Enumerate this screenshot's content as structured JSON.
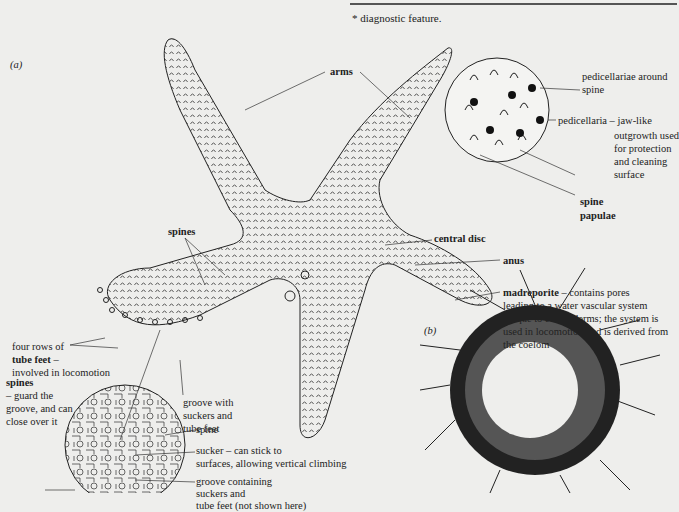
{
  "footnote": "* diagnostic feature.",
  "panel_a": {
    "label": "(a)",
    "labels": {
      "arms": "arms",
      "spines": "spines",
      "central_disc": "central disc",
      "anus": "anus",
      "madreporite_title": "madreporite",
      "madreporite_desc": [
        " – contains pores",
        "leading to a water vascular system",
        "unique to echinoderms; the system is",
        "used in locomotion and is derived from",
        "the coelom"
      ],
      "tube_feet_line1": "four rows of",
      "tube_feet_title": "tube feet",
      "tube_feet_dash": " –",
      "tube_feet_desc": "involved in locomotion",
      "groove_with": [
        "groove with",
        "suckers and",
        "tube feet"
      ]
    },
    "inset_pedicellariae": {
      "pedicellariae_around": [
        "pedicellariae around",
        "spine"
      ],
      "pedicellaria": [
        "pedicellaria – jaw-like",
        "outgrowth used",
        "for protection",
        "and cleaning",
        "surface"
      ],
      "spine": "spine",
      "papulae": "papulae"
    },
    "inset_groove": {
      "spines_title": "spines",
      "spines_desc": [
        "– guard the",
        "groove, and can",
        "close over it"
      ],
      "spine": "spine",
      "sucker": [
        "sucker – can stick to",
        "surfaces, allowing vertical climbing"
      ],
      "groove": [
        "groove containing",
        "suckers and",
        "tube feet (not shown here)"
      ]
    }
  },
  "panel_b": {
    "label": "(b)"
  }
}
